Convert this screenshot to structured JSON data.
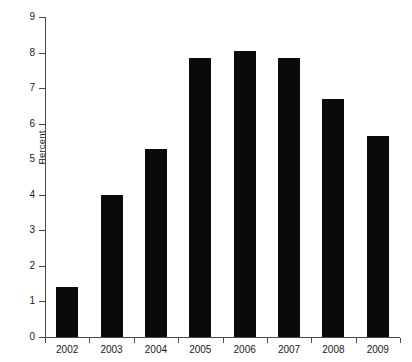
{
  "chart_data": {
    "type": "bar",
    "title": "",
    "subtitle": "",
    "xlabel": "",
    "ylabel": "Percent",
    "categories": [
      "2002",
      "2003",
      "2004",
      "2005",
      "2006",
      "2007",
      "2008",
      "2009"
    ],
    "values": [
      1.4,
      4.0,
      5.3,
      7.85,
      8.05,
      7.85,
      6.7,
      5.65
    ],
    "series": [
      {
        "name": "Percent",
        "values": [
          1.4,
          4.0,
          5.3,
          7.85,
          8.05,
          7.85,
          6.7,
          5.65
        ]
      }
    ],
    "ylim": [
      0,
      9
    ],
    "yticks": [
      0,
      1,
      2,
      3,
      4,
      5,
      6,
      7,
      8,
      9
    ],
    "ytick_labels": [
      "0",
      "1",
      "2",
      "3",
      "4",
      "5",
      "6",
      "7",
      "8",
      "9"
    ],
    "grid": false,
    "legend": false,
    "legend_position": "none",
    "bar_color": "#0a0a0a",
    "axis_color": "#4a4a4a",
    "background_color": "#ffffff",
    "annotations": []
  }
}
